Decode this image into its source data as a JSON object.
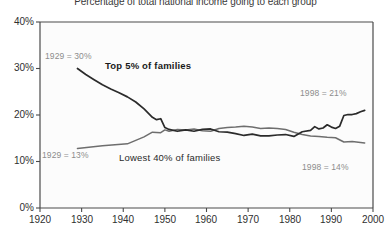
{
  "chart_data": {
    "type": "line",
    "title": "Percentage of total national income going to each group",
    "xlabel": "",
    "ylabel": "",
    "xlim": [
      1920,
      2000
    ],
    "ylim": [
      0,
      40
    ],
    "grid": false,
    "legend_position": "inline-annotations",
    "x_ticks": [
      "1920",
      "1930",
      "1940",
      "1950",
      "1960",
      "1970",
      "1980",
      "1990",
      "2000"
    ],
    "y_ticks": [
      "0%",
      "10%",
      "20%",
      "30%",
      "40%"
    ],
    "series": [
      {
        "name": "Top 5% of families",
        "color": "#2b2b2b",
        "label_bold": true,
        "start_annotation": "1929 = 30%",
        "end_annotation": "1998 = 21%",
        "x": [
          1929,
          1931,
          1933,
          1935,
          1937,
          1939,
          1941,
          1943,
          1945,
          1946,
          1947,
          1948,
          1949,
          1950,
          1951,
          1953,
          1955,
          1957,
          1959,
          1961,
          1963,
          1965,
          1967,
          1969,
          1971,
          1973,
          1975,
          1977,
          1979,
          1981,
          1983,
          1985,
          1986,
          1987,
          1988,
          1989,
          1990,
          1991,
          1992,
          1993,
          1994,
          1995,
          1996,
          1997,
          1998
        ],
        "y": [
          30.0,
          28.7,
          27.6,
          26.5,
          25.6,
          24.8,
          23.9,
          22.8,
          21.3,
          20.4,
          19.5,
          19.0,
          19.2,
          17.3,
          16.9,
          16.5,
          16.8,
          16.5,
          16.9,
          17.0,
          16.4,
          16.3,
          16.0,
          15.6,
          15.9,
          15.5,
          15.5,
          15.7,
          15.8,
          15.4,
          16.4,
          16.7,
          17.5,
          17.0,
          17.2,
          17.9,
          17.4,
          17.1,
          17.6,
          19.9,
          20.1,
          20.1,
          20.3,
          20.7,
          21.0
        ]
      },
      {
        "name": "Lowest 40% of families",
        "color": "#6e6e6e",
        "label_bold": false,
        "start_annotation": "1929 = 13%",
        "end_annotation": "1998 = 14%",
        "x": [
          1929,
          1935,
          1941,
          1945,
          1947,
          1949,
          1950,
          1951,
          1953,
          1955,
          1957,
          1959,
          1961,
          1963,
          1965,
          1967,
          1969,
          1971,
          1973,
          1975,
          1977,
          1979,
          1981,
          1983,
          1985,
          1987,
          1989,
          1991,
          1993,
          1995,
          1997,
          1998
        ],
        "y": [
          12.8,
          13.4,
          13.8,
          15.3,
          16.3,
          16.2,
          16.8,
          16.5,
          16.9,
          16.8,
          17.0,
          16.6,
          16.5,
          17.1,
          17.3,
          17.4,
          17.6,
          17.4,
          17.1,
          17.2,
          17.1,
          16.9,
          16.3,
          15.8,
          15.5,
          15.4,
          15.2,
          15.1,
          14.2,
          14.3,
          14.1,
          14.0
        ]
      }
    ]
  },
  "annotations": {
    "top_start": "1929 = 30%",
    "top_end": "1998 = 21%",
    "low_start": "1929 = 13%",
    "low_end": "1998 = 14%",
    "top_series_label": "Top 5% of families",
    "low_series_label": "Lowest 40% of families"
  },
  "axes": {
    "y": [
      "40%",
      "30%",
      "20%",
      "10%",
      "0%"
    ],
    "x": [
      "1920",
      "1930",
      "1940",
      "1950",
      "1960",
      "1970",
      "1980",
      "1990",
      "2000"
    ]
  }
}
